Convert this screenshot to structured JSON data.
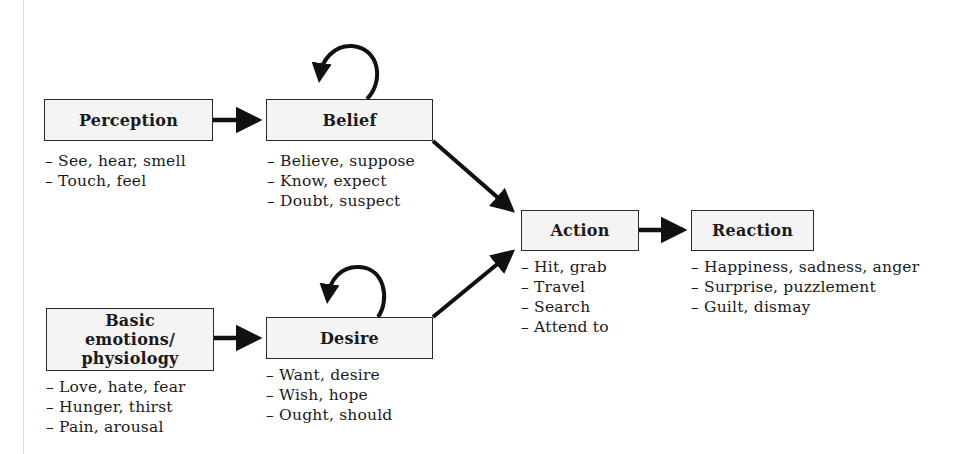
{
  "diagram": {
    "type": "flow",
    "nodes": {
      "perception": {
        "label": "Perception",
        "items": [
          "See, hear, smell",
          "Touch, feel"
        ]
      },
      "belief": {
        "label": "Belief",
        "items": [
          "Believe, suppose",
          "Know, expect",
          "Doubt, suspect"
        ]
      },
      "basic_emotions": {
        "label": "Basic emotions/ physiology",
        "items": [
          "Love, hate, fear",
          "Hunger, thirst",
          "Pain, arousal"
        ]
      },
      "desire": {
        "label": "Desire",
        "items": [
          "Want, desire",
          "Wish, hope",
          "Ought, should"
        ]
      },
      "action": {
        "label": "Action",
        "items": [
          "Hit, grab",
          "Travel",
          "Search",
          "Attend to"
        ]
      },
      "reaction": {
        "label": "Reaction",
        "items": [
          "Happiness, sadness, anger",
          "Surprise, puzzlement",
          "Guilt, dismay"
        ]
      }
    },
    "edges": [
      {
        "from": "Perception",
        "to": "Belief"
      },
      {
        "from": "Belief",
        "to": "Belief",
        "kind": "self-loop"
      },
      {
        "from": "Belief",
        "to": "Action"
      },
      {
        "from": "Basic emotions/ physiology",
        "to": "Desire"
      },
      {
        "from": "Desire",
        "to": "Desire",
        "kind": "self-loop"
      },
      {
        "from": "Desire",
        "to": "Action"
      },
      {
        "from": "Action",
        "to": "Reaction"
      }
    ],
    "colors": {
      "box_fill": "#f4f4f4",
      "stroke": "#111111"
    }
  }
}
